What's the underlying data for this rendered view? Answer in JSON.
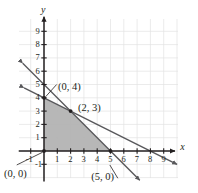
{
  "figure": {
    "type": "graph",
    "axis_labels": {
      "x": "x",
      "y": "y"
    },
    "x_ticks": [
      "-1",
      "1",
      "2",
      "3",
      "4",
      "5",
      "6",
      "7",
      "8",
      "9"
    ],
    "y_ticks": [
      "9",
      "8",
      "7",
      "6",
      "5",
      "4",
      "3",
      "2",
      "1",
      "-1"
    ],
    "point_labels": [
      {
        "id": "p-0-4",
        "text": "(0, 4)"
      },
      {
        "id": "p-2-3",
        "text": "(2, 3)"
      },
      {
        "id": "p-0-0",
        "text": "(0, 0)"
      },
      {
        "id": "p-5-0",
        "text": "(5, 0)"
      }
    ],
    "colors": {
      "grid": "#e3e3e3",
      "axis": "#231f20",
      "line": "#58585b",
      "shade": "#b3b3b3",
      "text": "#231f20"
    }
  },
  "chart_data": {
    "type": "scatter",
    "title": "",
    "xlabel": "x",
    "ylabel": "y",
    "xlim": [
      -1.6,
      10.2
    ],
    "ylim": [
      -2.4,
      10.4
    ],
    "grid": true,
    "legend": null,
    "x_tick_values": [
      -1,
      1,
      2,
      3,
      4,
      5,
      6,
      7,
      8,
      9
    ],
    "y_tick_values": [
      9,
      8,
      7,
      6,
      5,
      4,
      3,
      2,
      1,
      -1
    ],
    "series": [
      {
        "name": "line-steep",
        "type": "line",
        "equation": "x + y = 5",
        "points": [
          [
            -1.6,
            6.6
          ],
          [
            7.2,
            -2.2
          ]
        ],
        "arrows": "both"
      },
      {
        "name": "line-shallow",
        "type": "line",
        "equation": "x + 2y = 8",
        "points": [
          [
            -1.5,
            4.75
          ],
          [
            10.0,
            -1.0
          ]
        ],
        "arrows": "both"
      }
    ],
    "shaded_region": {
      "name": "feasible-region",
      "vertices": [
        [
          0,
          0
        ],
        [
          0,
          4
        ],
        [
          2,
          3
        ],
        [
          5,
          0
        ]
      ],
      "fill": "#b3b3b3"
    },
    "annotations": [
      {
        "text": "(0, 4)",
        "point": [
          0,
          4
        ],
        "label_at": [
          1.05,
          5.2
        ]
      },
      {
        "text": "(2, 3)",
        "point": [
          2,
          3
        ],
        "label_at": [
          2.55,
          3.6
        ]
      },
      {
        "text": "(0, 0)",
        "point": [
          0,
          0
        ],
        "label_at": [
          -3.0,
          -1.35
        ]
      },
      {
        "text": "(5, 0)",
        "point": [
          5,
          0
        ],
        "label_at": [
          3.55,
          -1.55
        ]
      }
    ],
    "vertex_markers": [
      [
        0,
        0
      ],
      [
        0,
        4
      ],
      [
        2,
        3
      ],
      [
        5,
        0
      ]
    ]
  }
}
